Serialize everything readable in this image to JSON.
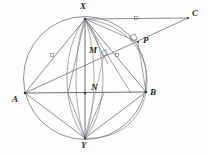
{
  "figure": {
    "background_color": "#fdfdfc",
    "stroke_color": "#6e6e78",
    "label_color": "#2a2a2a",
    "accent_color": "#8a8a94"
  },
  "labels": {
    "X": "X",
    "Y": "Y",
    "A": "A",
    "B": "B",
    "C": "C",
    "M": "M",
    "N": "N",
    "P": "P"
  },
  "points": {
    "X": {
      "name": "X",
      "x": 85,
      "y": 19
    },
    "Y": {
      "name": "Y",
      "x": 85,
      "y": 138
    },
    "A": {
      "name": "A",
      "x": 25,
      "y": 93
    },
    "B": {
      "name": "B",
      "x": 146,
      "y": 92
    },
    "C": {
      "name": "C",
      "x": 188,
      "y": 18
    },
    "M": {
      "name": "M",
      "x": 104,
      "y": 55
    },
    "N": {
      "name": "N",
      "x": 85,
      "y": 93
    },
    "P": {
      "name": "P",
      "x": 138,
      "y": 42
    }
  },
  "label_positions": {
    "X": {
      "x": 80,
      "y": 3
    },
    "Y": {
      "x": 81,
      "y": 142
    },
    "A": {
      "x": 13,
      "y": 94
    },
    "B": {
      "x": 150,
      "y": 89
    },
    "C": {
      "x": 192,
      "y": 10
    },
    "M": {
      "x": 90,
      "y": 47
    },
    "N": {
      "x": 92,
      "y": 84
    },
    "P": {
      "x": 143,
      "y": 37
    }
  },
  "circle": {
    "name": "circumcircle",
    "cx": 85,
    "cy": 78,
    "r": 61.5
  },
  "arcs": [
    {
      "name": "left-lens-arc",
      "d": "M 85 19 C 62 48 62 108 85 138"
    },
    {
      "name": "right-lens-arc",
      "d": "M 85 19 C 108 48 108 108 85 138"
    },
    {
      "name": "inner-left-lens-arc",
      "d": "M 85 19 C 72 50 72 106 85 138"
    },
    {
      "name": "inner-right-lens-arc",
      "d": "M 85 19 C 98 50 98 106 85 138"
    },
    {
      "name": "circle-through-X-P-B",
      "d": "M 85 19 C 123 24 152 54 146 92"
    }
  ],
  "segments": [
    {
      "name": "chord-A-B",
      "x1": 25,
      "y1": 93,
      "x2": 146,
      "y2": 92
    },
    {
      "name": "chord-X-Y",
      "x1": 85,
      "y1": 19,
      "x2": 85,
      "y2": 138
    },
    {
      "name": "chord-X-A",
      "x1": 85,
      "y1": 19,
      "x2": 25,
      "y2": 93
    },
    {
      "name": "chord-X-B",
      "x1": 85,
      "y1": 19,
      "x2": 146,
      "y2": 92
    },
    {
      "name": "chord-Y-A",
      "x1": 85,
      "y1": 138,
      "x2": 25,
      "y2": 93
    },
    {
      "name": "chord-Y-B",
      "x1": 85,
      "y1": 138,
      "x2": 146,
      "y2": 92
    },
    {
      "name": "line-X-C",
      "x1": 85,
      "y1": 19,
      "x2": 188,
      "y2": 18
    },
    {
      "name": "line-A-C-through-M-P",
      "x1": 25,
      "y1": 93,
      "x2": 188,
      "y2": 18
    },
    {
      "name": "segment-X-P",
      "x1": 85,
      "y1": 19,
      "x2": 138,
      "y2": 42
    },
    {
      "name": "segment-X-M",
      "x1": 85,
      "y1": 19,
      "x2": 104,
      "y2": 55
    },
    {
      "name": "segment-P-B",
      "x1": 138,
      "y1": 42,
      "x2": 146,
      "y2": 92
    },
    {
      "name": "segment-X-N-left-ray",
      "x1": 85,
      "y1": 19,
      "x2": 70,
      "y2": 93
    },
    {
      "name": "segment-Y-left-ray",
      "x1": 85,
      "y1": 138,
      "x2": 70,
      "y2": 93
    },
    {
      "name": "segment-Y-M-ray",
      "x1": 85,
      "y1": 138,
      "x2": 104,
      "y2": 55
    }
  ],
  "tick_marks": [
    {
      "name": "tick-on-AC-left",
      "x": 52,
      "y": 55
    },
    {
      "name": "tick-on-AC-right",
      "x": 117,
      "y": 55
    },
    {
      "name": "tick-on-XC",
      "x": 136,
      "y": 18
    }
  ],
  "right_angles": [
    {
      "name": "right-angle-at-M",
      "x": 103,
      "y": 54,
      "rotation": -25
    },
    {
      "name": "right-angle-at-P",
      "x": 133,
      "y": 38,
      "rotation": -25
    }
  ]
}
